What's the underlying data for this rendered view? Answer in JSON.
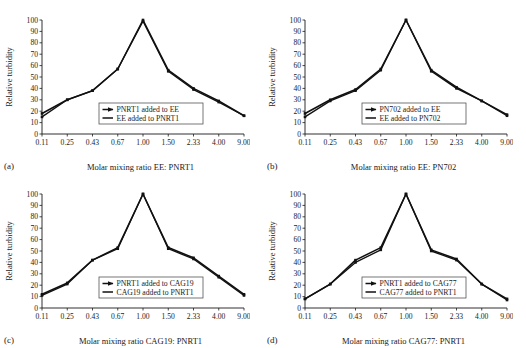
{
  "figure": {
    "background": "#ffffff",
    "line_color": "#111111",
    "panel_count": 4
  },
  "axis_common": {
    "y_label": "Relative turbidity",
    "y_ticks": [
      0,
      10,
      20,
      30,
      40,
      50,
      60,
      70,
      80,
      90,
      100
    ],
    "y_min": 0,
    "y_max": 100,
    "x_ticks": [
      "0.11",
      "0.25",
      "0.43",
      "0.67",
      "1.00",
      "1.50",
      "2.33",
      "4.00",
      "9.00"
    ]
  },
  "chart_data": [
    {
      "type": "line",
      "panel": "(a)",
      "title": "",
      "xlabel": "Molar mixing ratio EE: PNRT1",
      "ylabel": "Relative turbidity",
      "categories": [
        "0.11",
        "0.25",
        "0.43",
        "0.67",
        "1.00",
        "1.50",
        "2.33",
        "4.00",
        "9.00"
      ],
      "ylim": [
        0,
        100
      ],
      "grid": false,
      "legend_position": "center-bottom",
      "series": [
        {
          "name": "PNRT1 added to EE",
          "values": [
            18,
            30,
            38,
            57,
            100,
            56,
            40,
            29,
            16
          ]
        },
        {
          "name": "EE added to PNRT1",
          "values": [
            15,
            30,
            38,
            57,
            99,
            55,
            39,
            28,
            16
          ]
        }
      ]
    },
    {
      "type": "line",
      "panel": "(b)",
      "title": "",
      "xlabel": "Molar mixing ratio EE: PN702",
      "ylabel": "Relative turbidity",
      "categories": [
        "0.11",
        "0.25",
        "0.43",
        "0.67",
        "1.00",
        "1.50",
        "2.33",
        "4.00",
        "9.00"
      ],
      "ylim": [
        0,
        100
      ],
      "grid": false,
      "legend_position": "center-bottom",
      "series": [
        {
          "name": "PN702 added to EE",
          "values": [
            18,
            30,
            39,
            57,
            100,
            56,
            41,
            29,
            17
          ]
        },
        {
          "name": "EE added to PN702",
          "values": [
            15,
            29,
            38,
            56,
            100,
            55,
            40,
            29,
            16
          ]
        }
      ]
    },
    {
      "type": "line",
      "panel": "(c)",
      "title": "",
      "xlabel": "Molar mixing ratio CAG19: PNRT1",
      "ylabel": "Relative turbidity",
      "categories": [
        "0.11",
        "0.25",
        "0.43",
        "0.67",
        "1.00",
        "1.50",
        "2.33",
        "4.00",
        "9.00"
      ],
      "ylim": [
        0,
        100
      ],
      "grid": false,
      "legend_position": "center-bottom",
      "series": [
        {
          "name": "PNRT1 added to CAG19",
          "values": [
            12,
            22,
            42,
            53,
            100,
            53,
            44,
            28,
            12
          ]
        },
        {
          "name": "CAG19 added to PNRT1",
          "values": [
            11,
            21,
            42,
            52,
            100,
            52,
            43,
            27,
            11
          ]
        }
      ]
    },
    {
      "type": "line",
      "panel": "(d)",
      "title": "",
      "xlabel": "Molar mixing ratio CAG77: PNRT1",
      "ylabel": "Relative turbidity",
      "categories": [
        "0.11",
        "0.25",
        "0.43",
        "0.67",
        "1.00",
        "1.50",
        "2.33",
        "4.00",
        "9.00"
      ],
      "ylim": [
        0,
        100
      ],
      "grid": false,
      "legend_position": "center-bottom",
      "series": [
        {
          "name": "PNRT1 added to CAG77",
          "values": [
            8,
            21,
            42,
            53,
            100,
            51,
            43,
            21,
            8
          ]
        },
        {
          "name": "CAG77 added to PNRT1",
          "values": [
            8,
            21,
            40,
            51,
            100,
            50,
            42,
            21,
            7
          ]
        }
      ]
    }
  ]
}
